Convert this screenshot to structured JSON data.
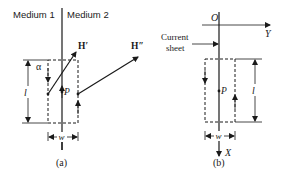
{
  "figure_a": {
    "medium1_label": "Medium 1",
    "medium2_label": "Medium 2",
    "h_prime_label": "H′",
    "h_double_prime_label": "H″",
    "alpha_label": "α",
    "l_label": "l",
    "p_label": "P",
    "w_label": "w",
    "caption": "(a)"
  },
  "figure_b": {
    "origin_label": "O",
    "y_axis_label": "Y",
    "x_axis_label": "X",
    "current_sheet_label_line1": "Current",
    "current_sheet_label_line2": "sheet",
    "l_label": "l",
    "p_label": "P",
    "w_label": "w",
    "caption": "(b)"
  },
  "colors": {
    "ink": "#1a1a1a",
    "background": "#ffffff"
  }
}
